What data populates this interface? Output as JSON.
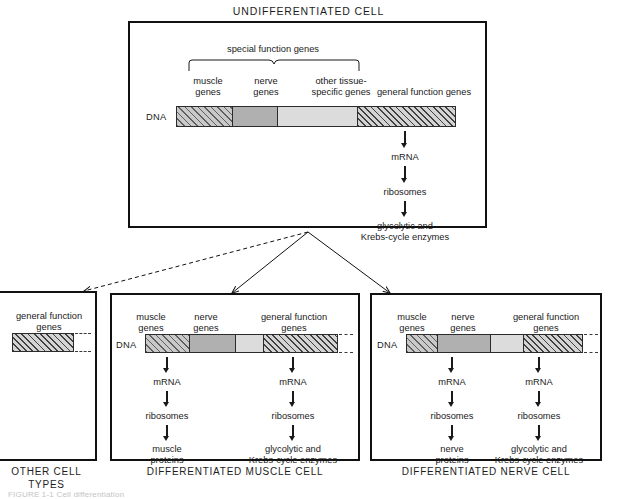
{
  "figure": {
    "top_title": "UNDIFFERENTIATED CELL",
    "bottom_caption_fragment": "FIGURE 1-1  Cell differentiation"
  },
  "colors": {
    "ink": "#111111",
    "hatch_light": "#c9c9c9",
    "hatch_dark": "#9f9f9f",
    "gray_medium": "#b0b0b0",
    "gray_light": "#dcdcdc"
  },
  "undifferentiated": {
    "title": "UNDIFFERENTIATED CELL",
    "brace_label": "special function genes",
    "dna_label": "DNA",
    "segments": [
      {
        "name": "muscle-genes",
        "label": "muscle\ngenes",
        "fill": "hatch-light"
      },
      {
        "name": "nerve-genes",
        "label": "nerve\ngenes",
        "fill": "gray-medium"
      },
      {
        "name": "other-tissue-specific-genes",
        "label": "other tissue-\nspecific genes",
        "fill": "gray-light"
      },
      {
        "name": "general-function-genes",
        "label": "general function genes",
        "fill": "hatch-dark"
      }
    ],
    "pathway": [
      "mRNA",
      "ribosomes",
      "glycolytic and\nKrebs-cycle enzymes"
    ]
  },
  "other_cell_types": {
    "caption": "OTHER CELL\nTYPES",
    "segment_label": "general function\ngenes"
  },
  "muscle_cell": {
    "caption": "DIFFERENTIATED MUSCLE CELL",
    "dna_label": "DNA",
    "segments": [
      {
        "name": "muscle-genes",
        "label": "muscle\ngenes",
        "fill": "hatch-light"
      },
      {
        "name": "nerve-genes",
        "label": "nerve\ngenes",
        "fill": "gray-medium"
      },
      {
        "name": "other-tissue-specific-genes",
        "label": "",
        "fill": "gray-light"
      },
      {
        "name": "general-function-genes",
        "label": "general function\ngenes",
        "fill": "hatch-dark"
      }
    ],
    "pathway_left": [
      "mRNA",
      "ribosomes",
      "muscle\nproteins"
    ],
    "pathway_right": [
      "mRNA",
      "ribosomes",
      "glycolytic and\nKrebs-cycle enzymes"
    ]
  },
  "nerve_cell": {
    "caption": "DIFFERENTIATED NERVE CELL",
    "dna_label": "DNA",
    "segments": [
      {
        "name": "muscle-genes",
        "label": "muscle\ngenes",
        "fill": "hatch-light"
      },
      {
        "name": "nerve-genes",
        "label": "nerve\ngenes",
        "fill": "gray-medium"
      },
      {
        "name": "other-tissue-specific-genes",
        "label": "",
        "fill": "gray-light"
      },
      {
        "name": "general-function-genes",
        "label": "general function\ngenes",
        "fill": "hatch-dark"
      }
    ],
    "pathway_left": [
      "mRNA",
      "ribosomes",
      "nerve\nproteins"
    ],
    "pathway_right": [
      "mRNA",
      "ribosomes",
      "glycolytic and\nKrebs-cycle enzymes"
    ]
  }
}
